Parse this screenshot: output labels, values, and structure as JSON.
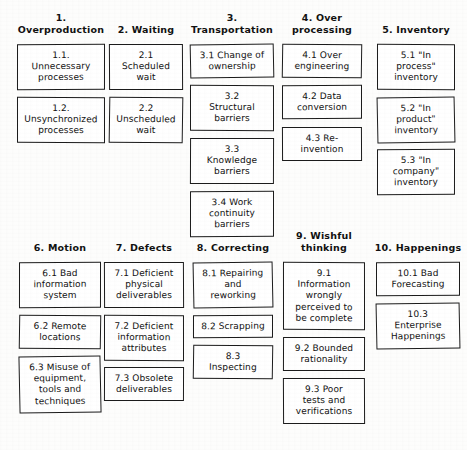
{
  "diagram": {
    "style": "hand-drawn scanned chart of waste categories",
    "background_color": "#fdfdfc",
    "box_border_color": "#1b1b1b",
    "box_fill_color": "#ffffff",
    "rows": [
      {
        "row_id": "top",
        "columns": [
          {
            "number": "1.",
            "title": "1.\nOverproduction",
            "items": [
              {
                "label": "1.1.\nUnnecessary\nprocesses"
              },
              {
                "label": "1.2.\nUnsynchronized\nprocesses"
              }
            ]
          },
          {
            "number": "2.",
            "title": "2. Waiting",
            "items": [
              {
                "label": "2.1\nScheduled\nwait"
              },
              {
                "label": "2.2\nUnscheduled\nwait"
              }
            ]
          },
          {
            "number": "3.",
            "title": "3.\nTransportation",
            "items": [
              {
                "label": "3.1 Change of\nownership"
              },
              {
                "label": "3.2\nStructural\nbarriers"
              },
              {
                "label": "3.3\nKnowledge\nbarriers"
              },
              {
                "label": "3.4 Work\ncontinuity\nbarriers"
              }
            ]
          },
          {
            "number": "4.",
            "title": "4. Over\nprocessing",
            "items": [
              {
                "label": "4.1 Over\nengineering"
              },
              {
                "label": "4.2 Data\nconversion"
              },
              {
                "label": "4.3 Re-\ninvention"
              }
            ]
          },
          {
            "number": "5.",
            "title": "5. Inventory",
            "items": [
              {
                "label": "5.1 \"In\nprocess\"\ninventory"
              },
              {
                "label": "5.2 \"In\nproduct\"\ninventory"
              },
              {
                "label": "5.3 \"In\ncompany\"\ninventory"
              }
            ]
          }
        ]
      },
      {
        "row_id": "bottom",
        "columns": [
          {
            "number": "6.",
            "title": "6. Motion",
            "items": [
              {
                "label": "6.1 Bad\ninformation\nsystem"
              },
              {
                "label": "6.2 Remote\nlocations"
              },
              {
                "label": "6.3 Misuse of\nequipment,\ntools and\ntechniques"
              }
            ]
          },
          {
            "number": "7.",
            "title": "7. Defects",
            "items": [
              {
                "label": "7.1 Deficient\nphysical\ndeliverables"
              },
              {
                "label": "7.2 Deficient\ninformation\nattributes"
              },
              {
                "label": "7.3 Obsolete\ndeliverables"
              }
            ]
          },
          {
            "number": "8.",
            "title": "8. Correcting",
            "items": [
              {
                "label": "8.1 Repairing\nand\nreworking"
              },
              {
                "label": "8.2 Scrapping"
              },
              {
                "label": "8.3\nInspecting"
              }
            ]
          },
          {
            "number": "9.",
            "title": "9. Wishful\nthinking",
            "items": [
              {
                "label": "9.1\nInformation\nwrongly\nperceived to\nbe complete"
              },
              {
                "label": "9.2 Bounded\nrationality"
              },
              {
                "label": "9.3 Poor\ntests and\nverifications"
              }
            ]
          },
          {
            "number": "10.",
            "title": "10. Happenings",
            "items": [
              {
                "label": "10.1 Bad\nForecasting"
              },
              {
                "label": "10.3\nEnterprise\nHappenings"
              }
            ]
          }
        ]
      }
    ]
  }
}
